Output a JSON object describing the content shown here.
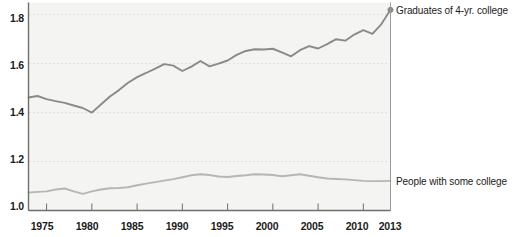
{
  "chart_data": {
    "type": "line",
    "title": "",
    "subtitle": "",
    "xlabel": "",
    "ylabel": "",
    "xlim": [
      1973,
      2013
    ],
    "ylim": [
      1.0,
      1.85
    ],
    "grid": true,
    "grid_style": "dotted-horizontal",
    "legend_position": "right-inline-annotation",
    "y_ticks": [
      "1.0",
      "1.2",
      "1.4",
      "1.6",
      "1.8"
    ],
    "y_tick_values": [
      1.0,
      1.2,
      1.4,
      1.6,
      1.8
    ],
    "x_ticks": [
      "1975",
      "1980",
      "1985",
      "1990",
      "1995",
      "2000",
      "2005",
      "2010",
      "2013"
    ],
    "x_tick_values": [
      1975,
      1980,
      1985,
      1990,
      1995,
      2000,
      2005,
      2010,
      2013
    ],
    "x": [
      1973,
      1974,
      1975,
      1976,
      1977,
      1978,
      1979,
      1980,
      1981,
      1982,
      1983,
      1984,
      1985,
      1986,
      1987,
      1988,
      1989,
      1990,
      1991,
      1992,
      1993,
      1994,
      1995,
      1996,
      1997,
      1998,
      1999,
      2000,
      2001,
      2002,
      2003,
      2004,
      2005,
      2006,
      2007,
      2008,
      2009,
      2010,
      2011,
      2012,
      2013
    ],
    "series": [
      {
        "name": "Graduates of 4-yr. college",
        "color": "#8a8a8a",
        "width": 1.9,
        "end_marker": true,
        "values": [
          1.462,
          1.468,
          1.455,
          1.447,
          1.44,
          1.429,
          1.419,
          1.4,
          1.433,
          1.466,
          1.492,
          1.522,
          1.545,
          1.562,
          1.58,
          1.598,
          1.592,
          1.57,
          1.588,
          1.611,
          1.589,
          1.6,
          1.613,
          1.636,
          1.652,
          1.659,
          1.658,
          1.661,
          1.646,
          1.63,
          1.655,
          1.672,
          1.662,
          1.68,
          1.7,
          1.694,
          1.719,
          1.737,
          1.722,
          1.762,
          1.82
        ]
      },
      {
        "name": "People with some college",
        "color": "#b6b6b6",
        "width": 1.9,
        "end_marker": false,
        "values": [
          1.073,
          1.076,
          1.078,
          1.086,
          1.09,
          1.078,
          1.068,
          1.078,
          1.086,
          1.091,
          1.092,
          1.095,
          1.103,
          1.11,
          1.116,
          1.122,
          1.128,
          1.136,
          1.144,
          1.148,
          1.145,
          1.139,
          1.137,
          1.141,
          1.144,
          1.148,
          1.147,
          1.145,
          1.14,
          1.144,
          1.148,
          1.142,
          1.136,
          1.131,
          1.129,
          1.127,
          1.124,
          1.121,
          1.12,
          1.12,
          1.121
        ]
      }
    ],
    "annotations": [
      {
        "text": "Graduates of 4-yr. college",
        "series": 0,
        "anchor": "end"
      },
      {
        "text": "People with some college",
        "series": 1,
        "anchor": "end"
      }
    ]
  },
  "axis": {
    "y_labels": [
      "1.8",
      "1.6",
      "1.4",
      "1.2",
      "1.0"
    ],
    "x_labels": [
      "1975",
      "1980",
      "1985",
      "1990",
      "1995",
      "2000",
      "2005",
      "2010",
      "2013"
    ]
  },
  "labels": {
    "top_series": "Graduates of 4-yr. college",
    "bottom_series": "People with some college"
  },
  "background_bleed": [
    "the wage premium has risen steadily",
    "earnings gap between college",
    "and high school graduates",
    "relative earnings of workers with",
    "at least a bachelor's degree",
    "have risen substantially since the",
    "late 1970s, while the returns to",
    "some college have remained flat",
    "comparatively little changed over"
  ],
  "colors": {
    "line_top": "#8a8a8a",
    "line_bottom": "#b6b6b6",
    "axis": "#6e6e6e",
    "grid": "#c9c9c9",
    "plot_bg": "#f4f4f2",
    "text": "#1b1b1b"
  }
}
